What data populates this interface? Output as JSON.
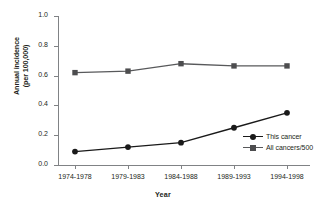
{
  "chart_data": {
    "type": "line",
    "title": "",
    "xlabel": "Year",
    "ylabel": "Annual incidence (per 100,000)",
    "ylabel_line1": "Annual incidence",
    "ylabel_line2": "(per 100,000)",
    "categories": [
      "1974-1978",
      "1979-1983",
      "1984-1988",
      "1989-1993",
      "1994-1998"
    ],
    "series": [
      {
        "name": "This cancer",
        "marker": "circle",
        "color": "#1a1a1a",
        "values": [
          0.09,
          0.12,
          0.15,
          0.25,
          0.35
        ]
      },
      {
        "name": "All cancers/500",
        "marker": "square",
        "color": "#4d4d4f",
        "values": [
          0.62,
          0.63,
          0.68,
          0.665,
          0.665
        ]
      }
    ],
    "ylim": [
      0.0,
      1.0
    ],
    "ytick_labels": [
      "1.0",
      "0.8",
      "0.6",
      "0.4",
      "0.2",
      "0.0"
    ],
    "ytick_values": [
      1.0,
      0.8,
      0.6,
      0.4,
      0.2,
      0.0
    ],
    "grid": false,
    "legend_position": "inside-right"
  },
  "axis": {
    "y_title_line1": "Annual incidence",
    "y_title_line2": "(per 100,000)",
    "x_title": "Year"
  },
  "legend": {
    "items": [
      {
        "label": "This cancer"
      },
      {
        "label": "All cancers/500"
      }
    ]
  }
}
